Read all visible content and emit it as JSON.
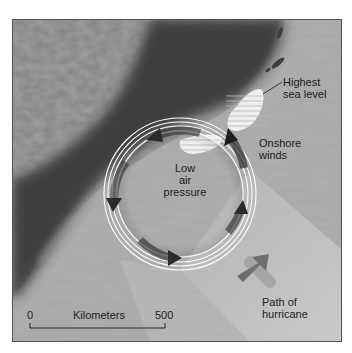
{
  "figure": {
    "colors": {
      "land_texture": "#7a7a7a",
      "land_dark": "#3a3a3a",
      "sea": "#a9a9a9",
      "path_band": "#c8c8c8",
      "rings": "#ffffff",
      "arrows": "#2a2a2a",
      "text": "#1c1c1c",
      "frame": "#555555"
    }
  },
  "labels": {
    "highest_sea_level_line1": "Highest",
    "highest_sea_level_line2": "sea level",
    "onshore_winds_line1": "Onshore",
    "onshore_winds_line2": "winds",
    "low_pressure_line1": "Low",
    "low_pressure_line2": "air",
    "low_pressure_line3": "pressure",
    "path_line1": "Path of",
    "path_line2": "hurricane"
  },
  "scale_bar": {
    "unit": "Kilometers",
    "min": "0",
    "max": "500"
  },
  "storm": {
    "rotation": "counterclockwise",
    "arrow_count": 4,
    "ring_count": 4
  }
}
